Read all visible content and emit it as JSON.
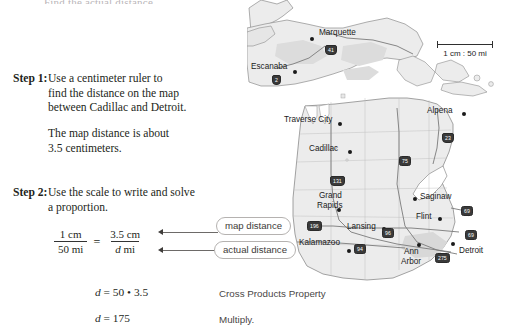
{
  "cut_top_line": "Find the actual distance.",
  "steps": [
    {
      "label": "Step 1:",
      "lines": [
        "Use a centimeter ruler to",
        "find the distance on the map",
        "between Cadillac and Detroit."
      ]
    },
    {
      "label": "",
      "lines": [
        "The map distance is about",
        "3.5 centimeters."
      ]
    },
    {
      "label": "Step 2:",
      "lines": [
        "Use the scale to write and solve",
        "a proportion."
      ]
    }
  ],
  "proportion": {
    "left_numerator": "1 cm",
    "left_denominator": "50 mi",
    "equals": "=",
    "right_numerator": "3.5 cm",
    "right_denominator_italic": "d",
    "right_denominator_rest": " mi"
  },
  "callouts": [
    {
      "label": "map distance"
    },
    {
      "label": "actual distance"
    }
  ],
  "equations": [
    {
      "math_d": "d",
      "math_rest": " = 50 • 3.5",
      "reason": "Cross Products Property"
    },
    {
      "math_d": "d",
      "math_rest": " = 175",
      "reason": "Multiply."
    }
  ],
  "map": {
    "scale": {
      "text": "1 cm : 50 mi"
    },
    "cities": [
      {
        "name": "Marquette",
        "x": 72,
        "y": 30
      },
      {
        "name": "Escanaba",
        "x": 22,
        "y": 64
      },
      {
        "name": "Traverse City",
        "x": 46,
        "y": 117
      },
      {
        "name": "Alpena",
        "x": 180,
        "y": 113
      },
      {
        "name": "Cadillac",
        "x": 62,
        "y": 152
      },
      {
        "name": "Grand",
        "x": 72,
        "y": 193
      },
      {
        "name": "Rapids",
        "x": 73,
        "y": 203
      },
      {
        "name": "Saginaw",
        "x": 175,
        "y": 198
      },
      {
        "name": "Flint",
        "x": 166,
        "y": 216
      },
      {
        "name": "Lansing",
        "x": 100,
        "y": 228
      },
      {
        "name": "Kalamazoo",
        "x": 60,
        "y": 243
      },
      {
        "name": "Ann",
        "x": 146,
        "y": 250
      },
      {
        "name": "Arbor",
        "x": 144,
        "y": 260
      },
      {
        "name": "Detroit",
        "x": 213,
        "y": 252
      }
    ],
    "shields": [
      {
        "number": "41",
        "x": 78,
        "y": 47
      },
      {
        "number": "2",
        "x": 25,
        "y": 77
      },
      {
        "number": "23",
        "x": 195,
        "y": 135
      },
      {
        "number": "75",
        "x": 152,
        "y": 158
      },
      {
        "number": "131",
        "x": 83,
        "y": 178
      },
      {
        "number": "69",
        "x": 214,
        "y": 208
      },
      {
        "number": "196",
        "x": 60,
        "y": 223
      },
      {
        "number": "96",
        "x": 135,
        "y": 230
      },
      {
        "number": "69",
        "x": 218,
        "y": 232
      },
      {
        "number": "94",
        "x": 107,
        "y": 246
      },
      {
        "number": "275",
        "x": 188,
        "y": 255
      }
    ]
  }
}
